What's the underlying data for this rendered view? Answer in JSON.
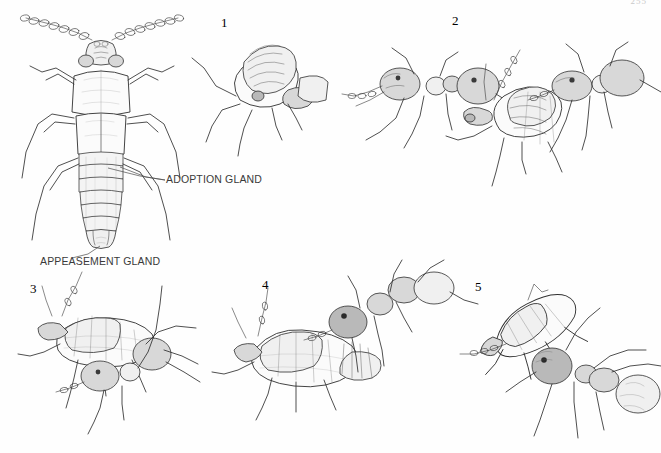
{
  "plate": {
    "page_number": "255",
    "kind": "scientific-illustration-plate",
    "subject": "Myrmecophilous staphylinid beetle and host ant interaction sequence"
  },
  "main_figure": {
    "name": "dorsal-beetle-diagram",
    "labels": [
      {
        "id": "adoption-gland",
        "text": "ADOPTION GLAND"
      },
      {
        "id": "appeasement-gland",
        "text": "APPEASEMENT GLAND"
      }
    ]
  },
  "figures": [
    {
      "number": "1",
      "name": "figure-1-beetle-meets-ant",
      "caption": ""
    },
    {
      "number": "2",
      "name": "figure-2-ant-licks-abdomen",
      "caption": ""
    },
    {
      "number": "3",
      "name": "figure-3-ant-grasps-beetle",
      "caption": ""
    },
    {
      "number": "4",
      "name": "figure-4-ant-seizes-beetle",
      "caption": ""
    },
    {
      "number": "5",
      "name": "figure-5-ant-carries-beetle",
      "caption": ""
    }
  ],
  "colors": {
    "ink": "#2f2f2f",
    "paper": "#fefefe",
    "label_text": "#3a3a3a",
    "page_number": "#c9c9c9"
  }
}
